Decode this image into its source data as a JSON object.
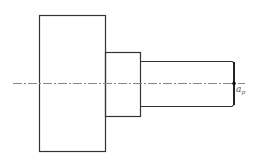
{
  "diagram": {
    "type": "stepped-shaft-drawing",
    "colors": {
      "outline": "#333333",
      "centerline": "#888888",
      "label": "#555555",
      "background": "#ffffff"
    },
    "centerline": {
      "y": 83,
      "x1": 13,
      "x2": 245,
      "style": "dash-dot"
    },
    "sections": [
      {
        "name": "large-section",
        "x": 39,
        "y": 15,
        "width": 66,
        "height": 136
      },
      {
        "name": "middle-section",
        "x": 105,
        "y": 52,
        "width": 35,
        "height": 64
      },
      {
        "name": "small-section",
        "x": 140,
        "y": 61,
        "width": 93,
        "height": 45
      }
    ],
    "end_face": {
      "x": 233,
      "y1": 61,
      "y2": 106
    },
    "point": {
      "x": 234,
      "y": 83
    },
    "label": {
      "base": "a",
      "subscript": "p"
    }
  }
}
